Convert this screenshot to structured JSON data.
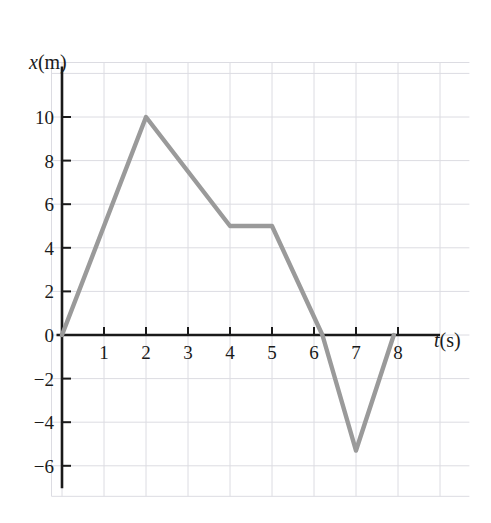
{
  "figure": {
    "axis_label_y": "x(m)",
    "axis_label_y_var": "x",
    "axis_label_y_unit": "(m)",
    "axis_label_x": "t(s)",
    "axis_label_x_var": "t",
    "axis_label_x_unit": "(s)",
    "curve_color": "#9a9a9a",
    "axis_color": "#1a1a1a",
    "grid_color": "#dcdce2",
    "background_color": "#ffffff"
  },
  "chart_data": {
    "type": "line",
    "title": "",
    "subtitle": "",
    "xlabel": "t(s)",
    "ylabel": "x(m)",
    "xlim": [
      -0.25,
      9.7
    ],
    "ylim": [
      -7.4,
      12.5
    ],
    "xticks": [
      1,
      2,
      3,
      4,
      5,
      6,
      7,
      8
    ],
    "xtick_labels": [
      "1",
      "2",
      "3",
      "4",
      "5",
      "6",
      "7",
      "8"
    ],
    "yticks": [
      10,
      8,
      6,
      4,
      2,
      0,
      -2,
      -4,
      -6
    ],
    "ytick_labels": [
      "10",
      "8",
      "6",
      "4",
      "2",
      "0",
      "-2",
      "-4",
      "-6"
    ],
    "grid": true,
    "grid_x_step": 1,
    "grid_y_step": 2,
    "legend": null,
    "legend_position": "none",
    "annotations": [],
    "series": [
      {
        "name": "position",
        "x": [
          0,
          2,
          4,
          5,
          6.2,
          7,
          7.9
        ],
        "y": [
          0,
          10,
          5,
          5,
          0,
          -5.3,
          0
        ]
      }
    ]
  }
}
